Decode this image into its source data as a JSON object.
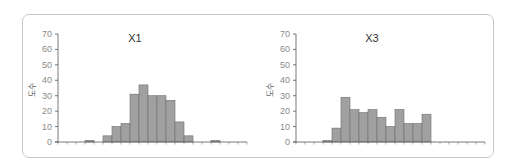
{
  "chart_data": [
    {
      "type": "bar",
      "title": "X1",
      "xlabel": "",
      "ylabel": "도수",
      "ylim": [
        0,
        70
      ],
      "yticks": [
        0,
        10,
        20,
        30,
        40,
        50,
        60,
        70
      ],
      "grid": false,
      "legend": null,
      "bins": 21,
      "values": [
        0,
        0,
        0,
        1,
        0,
        4,
        10,
        12,
        31,
        37,
        30,
        30,
        27,
        13,
        4,
        0,
        0,
        1,
        0,
        0,
        0
      ],
      "bar_color": "#a0a0a0"
    },
    {
      "type": "bar",
      "title": "X3",
      "xlabel": "",
      "ylabel": "도수",
      "ylim": [
        0,
        70
      ],
      "yticks": [
        0,
        10,
        20,
        30,
        40,
        50,
        60,
        70
      ],
      "grid": false,
      "legend": null,
      "bins": 21,
      "values": [
        0,
        0,
        0,
        1,
        9,
        29,
        21,
        19,
        21,
        16,
        10,
        21,
        12,
        12,
        18,
        0,
        0,
        0,
        0,
        0,
        0
      ],
      "bar_color": "#a0a0a0"
    }
  ],
  "charts": [
    {
      "title": "X1",
      "ylabel": "도수"
    },
    {
      "title": "X3",
      "ylabel": "도수"
    }
  ]
}
